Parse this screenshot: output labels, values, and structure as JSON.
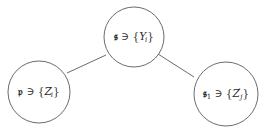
{
  "diagram": {
    "colors": {
      "stroke": "#6b6b6b",
      "text": "#2a2a2a",
      "background": "#ffffff"
    },
    "nodes": [
      {
        "id": "s",
        "cx": 134,
        "cy": 37,
        "r": 30,
        "label": {
          "symbol": "𝔰",
          "subscript": "",
          "relation": "∋",
          "set_open": "{",
          "var": "Y",
          "var_sub": "i",
          "var_prime": "",
          "set_close": "}"
        }
      },
      {
        "id": "p",
        "cx": 39,
        "cy": 92,
        "r": 31,
        "label": {
          "symbol": "𝔭",
          "subscript": "",
          "relation": "∋",
          "set_open": "{",
          "var": "Z",
          "var_sub": "i",
          "var_prime": "",
          "set_close": "}"
        }
      },
      {
        "id": "s1",
        "cx": 226,
        "cy": 94,
        "r": 32,
        "label": {
          "symbol": "𝔰",
          "subscript": "1",
          "relation": "∋",
          "set_open": "{",
          "var": "Z",
          "var_sub": "j",
          "var_prime": "′",
          "set_close": "}"
        }
      }
    ],
    "edges": [
      {
        "from": "s",
        "to": "p",
        "x1": 106,
        "y1": 55,
        "x2": 67,
        "y2": 73
      },
      {
        "from": "s",
        "to": "s1",
        "x1": 158,
        "y1": 54,
        "x2": 194,
        "y2": 77
      }
    ]
  }
}
